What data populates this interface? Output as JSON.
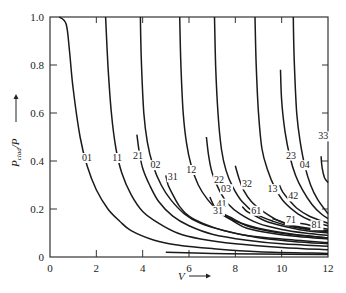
{
  "chart_data": {
    "type": "line",
    "title": "",
    "xlabel": "V",
    "ylabel": "P_clad/P",
    "xlim": [
      0,
      12
    ],
    "ylim": [
      0,
      1.0
    ],
    "x_ticks": [
      0,
      2,
      4,
      6,
      8,
      10,
      12
    ],
    "y_ticks": [
      0,
      0.2,
      0.4,
      0.6,
      0.8,
      1.0
    ],
    "x_tick_labels": [
      "0",
      "2",
      "4",
      "6",
      "8",
      "10",
      "12"
    ],
    "y_tick_labels": [
      "0",
      "0.2",
      "0.4",
      "0.6",
      "0.8",
      "1.0"
    ],
    "grid": false,
    "legend": "none (curves labeled inline)",
    "series": [
      {
        "name": "01",
        "label_at": [
          1.6,
          0.4
        ],
        "points": [
          [
            0.4,
            1.0
          ],
          [
            0.7,
            0.97
          ],
          [
            0.85,
            0.85
          ],
          [
            1.0,
            0.7
          ],
          [
            1.3,
            0.5
          ],
          [
            1.6,
            0.38
          ],
          [
            2.0,
            0.28
          ],
          [
            2.5,
            0.2
          ],
          [
            3.0,
            0.15
          ],
          [
            3.5,
            0.11
          ],
          [
            4.5,
            0.07
          ],
          [
            5.5,
            0.05
          ],
          [
            7,
            0.035
          ],
          [
            9,
            0.022
          ],
          [
            12,
            0.015
          ]
        ]
      },
      {
        "name": "11",
        "label_at": [
          2.9,
          0.4
        ],
        "points": [
          [
            2.4,
            1.0
          ],
          [
            2.5,
            0.8
          ],
          [
            2.65,
            0.6
          ],
          [
            2.85,
            0.45
          ],
          [
            3.1,
            0.35
          ],
          [
            3.5,
            0.26
          ],
          [
            4.0,
            0.19
          ],
          [
            4.7,
            0.14
          ],
          [
            5.5,
            0.1
          ],
          [
            6.5,
            0.075
          ],
          [
            8,
            0.055
          ],
          [
            10,
            0.04
          ],
          [
            12,
            0.03
          ]
        ]
      },
      {
        "name": "21",
        "label_at": [
          3.8,
          0.41
        ],
        "points": [
          [
            3.75,
            0.51
          ],
          [
            3.85,
            0.44
          ],
          [
            4.0,
            0.37
          ],
          [
            4.3,
            0.3
          ],
          [
            4.7,
            0.23
          ],
          [
            5.3,
            0.17
          ],
          [
            6,
            0.13
          ],
          [
            7,
            0.095
          ],
          [
            8.5,
            0.07
          ],
          [
            10,
            0.055
          ],
          [
            12,
            0.045
          ]
        ]
      },
      {
        "name": "02",
        "label_at": [
          4.55,
          0.37
        ],
        "points": [
          [
            3.9,
            1.0
          ],
          [
            3.95,
            0.8
          ],
          [
            4.05,
            0.6
          ],
          [
            4.2,
            0.48
          ],
          [
            4.45,
            0.38
          ],
          [
            4.8,
            0.3
          ],
          [
            5.2,
            0.24
          ],
          [
            5.8,
            0.18
          ],
          [
            6.5,
            0.14
          ],
          [
            7.5,
            0.11
          ],
          [
            9,
            0.08
          ],
          [
            10.5,
            0.065
          ],
          [
            12,
            0.055
          ]
        ]
      },
      {
        "name": "31",
        "label_at": [
          5.3,
          0.32
        ],
        "points": [
          [
            5.0,
            0.34
          ],
          [
            5.1,
            0.3
          ],
          [
            5.3,
            0.26
          ],
          [
            5.6,
            0.21
          ],
          [
            6,
            0.17
          ],
          [
            6.6,
            0.14
          ],
          [
            7.5,
            0.11
          ],
          [
            8.5,
            0.09
          ],
          [
            10,
            0.075
          ],
          [
            12,
            0.06
          ]
        ]
      },
      {
        "name": "12",
        "label_at": [
          6.1,
          0.35
        ],
        "points": [
          [
            5.6,
            1.0
          ],
          [
            5.65,
            0.8
          ],
          [
            5.75,
            0.6
          ],
          [
            5.9,
            0.47
          ],
          [
            6.1,
            0.38
          ],
          [
            6.4,
            0.3
          ],
          [
            6.8,
            0.24
          ],
          [
            7.3,
            0.19
          ],
          [
            8,
            0.15
          ],
          [
            9,
            0.12
          ],
          [
            10.5,
            0.095
          ],
          [
            12,
            0.08
          ]
        ]
      },
      {
        "name": "41",
        "label_at": [
          7.4,
          0.21
        ],
        "points": [
          [
            6.9,
            0.25
          ],
          [
            7.1,
            0.21
          ],
          [
            7.4,
            0.18
          ],
          [
            7.9,
            0.15
          ],
          [
            8.5,
            0.12
          ],
          [
            9.5,
            0.1
          ],
          [
            10.7,
            0.085
          ],
          [
            12,
            0.075
          ]
        ]
      },
      {
        "name": "22",
        "label_at": [
          7.3,
          0.31
        ],
        "points": [
          [
            6.75,
            0.5
          ],
          [
            6.85,
            0.42
          ],
          [
            7.0,
            0.35
          ],
          [
            7.3,
            0.28
          ],
          [
            7.7,
            0.22
          ],
          [
            8.2,
            0.18
          ],
          [
            9,
            0.14
          ],
          [
            10,
            0.115
          ],
          [
            11,
            0.1
          ],
          [
            12,
            0.09
          ]
        ]
      },
      {
        "name": "03",
        "label_at": [
          7.6,
          0.27
        ],
        "points": [
          [
            7.1,
            1.0
          ],
          [
            7.15,
            0.8
          ],
          [
            7.25,
            0.6
          ],
          [
            7.4,
            0.45
          ],
          [
            7.6,
            0.36
          ],
          [
            7.9,
            0.29
          ],
          [
            8.3,
            0.23
          ],
          [
            8.9,
            0.18
          ],
          [
            9.6,
            0.15
          ],
          [
            10.5,
            0.125
          ],
          [
            12,
            0.105
          ]
        ]
      },
      {
        "name": "31b",
        "display": "31",
        "label_at": [
          7.25,
          0.18
        ],
        "points": [
          [
            7.3,
            0.2
          ],
          [
            7.5,
            0.18
          ],
          [
            7.9,
            0.16
          ],
          [
            8.5,
            0.13
          ],
          [
            9.3,
            0.11
          ],
          [
            10.3,
            0.095
          ],
          [
            12,
            0.08
          ]
        ]
      },
      {
        "name": "32",
        "label_at": [
          8.5,
          0.29
        ],
        "points": [
          [
            8.0,
            0.38
          ],
          [
            8.15,
            0.33
          ],
          [
            8.35,
            0.28
          ],
          [
            8.7,
            0.23
          ],
          [
            9.2,
            0.19
          ],
          [
            9.9,
            0.15
          ],
          [
            10.8,
            0.125
          ],
          [
            12,
            0.11
          ]
        ]
      },
      {
        "name": "61",
        "label_at": [
          8.9,
          0.18
        ],
        "points": [
          [
            8.3,
            0.21
          ],
          [
            8.5,
            0.19
          ],
          [
            8.8,
            0.175
          ],
          [
            9.3,
            0.15
          ],
          [
            10,
            0.13
          ],
          [
            11,
            0.11
          ],
          [
            12,
            0.1
          ]
        ]
      },
      {
        "name": "13",
        "label_at": [
          9.6,
          0.27
        ],
        "points": [
          [
            8.85,
            1.0
          ],
          [
            8.9,
            0.8
          ],
          [
            9.0,
            0.6
          ],
          [
            9.15,
            0.45
          ],
          [
            9.4,
            0.36
          ],
          [
            9.7,
            0.29
          ],
          [
            10.1,
            0.23
          ],
          [
            10.7,
            0.18
          ],
          [
            11.3,
            0.15
          ],
          [
            12,
            0.13
          ]
        ]
      },
      {
        "name": "42",
        "label_at": [
          10.5,
          0.24
        ],
        "points": [
          [
            9.9,
            0.3
          ],
          [
            10.05,
            0.27
          ],
          [
            10.3,
            0.24
          ],
          [
            10.7,
            0.2
          ],
          [
            11.2,
            0.17
          ],
          [
            12,
            0.14
          ]
        ]
      },
      {
        "name": "71",
        "label_at": [
          10.4,
          0.14
        ],
        "points": [
          [
            9.6,
            0.16
          ],
          [
            9.9,
            0.15
          ],
          [
            10.3,
            0.135
          ],
          [
            10.9,
            0.12
          ],
          [
            11.5,
            0.11
          ],
          [
            12,
            0.105
          ]
        ]
      },
      {
        "name": "23",
        "label_at": [
          10.4,
          0.41
        ],
        "points": [
          [
            9.95,
            0.78
          ],
          [
            10.0,
            0.65
          ],
          [
            10.15,
            0.52
          ],
          [
            10.35,
            0.42
          ],
          [
            10.6,
            0.34
          ],
          [
            10.9,
            0.28
          ],
          [
            11.3,
            0.22
          ],
          [
            11.7,
            0.18
          ],
          [
            12,
            0.16
          ]
        ]
      },
      {
        "name": "04",
        "label_at": [
          11.0,
          0.37
        ],
        "points": [
          [
            10.5,
            1.0
          ],
          [
            10.55,
            0.8
          ],
          [
            10.65,
            0.6
          ],
          [
            10.8,
            0.48
          ],
          [
            11.0,
            0.38
          ],
          [
            11.25,
            0.3
          ],
          [
            11.55,
            0.24
          ],
          [
            12,
            0.18
          ]
        ]
      },
      {
        "name": "81",
        "label_at": [
          11.5,
          0.12
        ],
        "points": [
          [
            10.8,
            0.14
          ],
          [
            11.1,
            0.135
          ],
          [
            11.5,
            0.125
          ],
          [
            12,
            0.115
          ]
        ]
      },
      {
        "name": "33",
        "label_at": [
          11.8,
          0.49
        ],
        "points": [
          [
            11.7,
            0.42
          ],
          [
            11.75,
            0.37
          ],
          [
            11.85,
            0.33
          ],
          [
            12,
            0.31
          ]
        ]
      },
      {
        "name": "base1",
        "display": "",
        "points": [
          [
            5,
            0.02
          ],
          [
            7,
            0.015
          ],
          [
            9,
            0.012
          ],
          [
            12,
            0.01
          ]
        ]
      }
    ]
  }
}
